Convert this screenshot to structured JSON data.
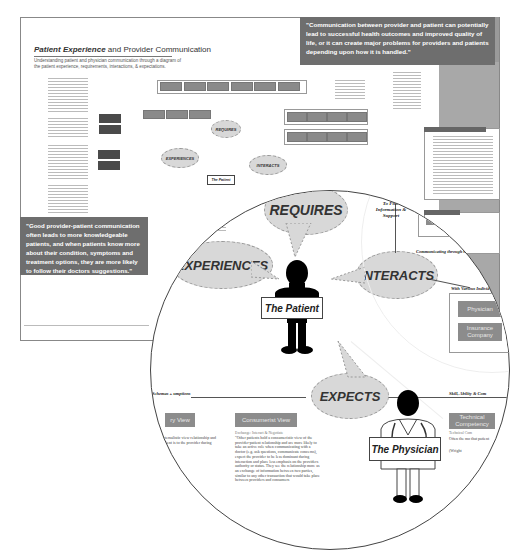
{
  "poster": {
    "title_bold": "Patient Experience",
    "title_rest": " and Provider Communication",
    "subtitle": "Understanding patient and physician communication through a diagram of the patient experience, requirements, interactions, & expectations.",
    "quote_top": "\"Communication between provider and patient can potentially lead to successful health outcomes and improved quality of life, or it can create major problems for providers and patients depending upon how it is handled.\"",
    "quote_left": "\"Good provider-patient communication often leads to more knowledgeable patients, and when patients know more about their condition, symptoms and treatment options, they are more likely to follow their doctors suggestions.\"",
    "footer_credit": "A Case Study of Patient Experience and Provider Communication Diagram"
  },
  "small_diagram": {
    "bubbles": [
      "REQUIRES",
      "EXPERIENCES",
      "INTERACTS"
    ],
    "patient_label": "The Patient",
    "labels": [
      "Skills",
      "(Trade, Basic & Small)",
      "Types of User Perceptions",
      "To Find Information & Support",
      "Communicating through Channels",
      "With Various Individuals"
    ]
  },
  "magnifier": {
    "bubbles": {
      "requires": "REQUIRES",
      "experiences": "EXPERIENCES",
      "interacts": "INTERACTS",
      "expects": "EXPECTS"
    },
    "patient_label": "The Patient",
    "physician_label": "The Physician",
    "labels": {
      "find_info": "To Find Information & Support",
      "communicating": "Communicating through Chat",
      "individuals": "With Various Individ",
      "schemas": "r Schemas + umptions",
      "skill": "Skill, Ability & Com"
    },
    "boxes": {
      "info_email": "The Integrated Email",
      "physician": "Physician",
      "insurance": "Insurance Company",
      "view_left": "ry View",
      "consumerist": "Consumerist View",
      "technical": "Technical Competency"
    },
    "paragraphs": {
      "consumerist_heading": "Exchange: Interact & Negotiate",
      "consumerist_body": "\"Other patients hold a consumeristic view of the provider-patient relationship and are more likely to take an active role when communicating with a doctor (e.g. ask questions, communicate concerns), expect the provider to be less dominant during interaction and place less emphasis on the providers authority or status. They see the relationship more as an exchange of information between two parties, similar to any other transaction that would take place between providers and consumers",
      "left_body": "paternalistic view relationship and patient is to the provider during that",
      "technical_heading": "Technical Com",
      "technical_body": "Often the mo that patient",
      "technical_cite": "(Wright"
    }
  }
}
